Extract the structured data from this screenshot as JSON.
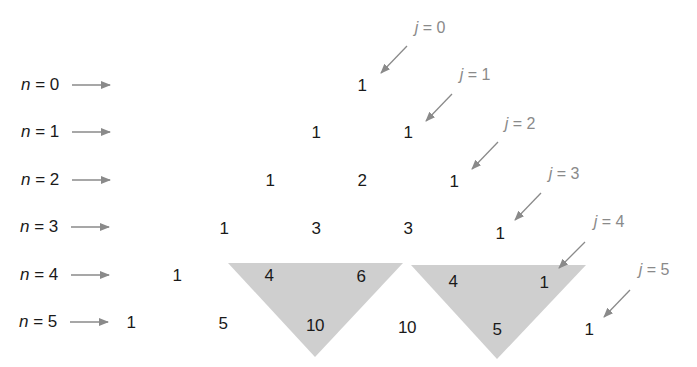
{
  "colors": {
    "text": "#1a1a1a",
    "arrow": "#8a8a8a",
    "label_j": "#8a8a8a",
    "highlight_fill": "#cfcfcf"
  },
  "row_labels": [
    {
      "var": "n",
      "eq": " = ",
      "value": "0"
    },
    {
      "var": "n",
      "eq": " = ",
      "value": "1"
    },
    {
      "var": "n",
      "eq": " = ",
      "value": "2"
    },
    {
      "var": "n",
      "eq": " = ",
      "value": "3"
    },
    {
      "var": "n",
      "eq": " = ",
      "value": "4"
    },
    {
      "var": "n",
      "eq": " = ",
      "value": "5"
    }
  ],
  "diagonal_labels": [
    {
      "var": "j",
      "eq": " = ",
      "value": "0"
    },
    {
      "var": "j",
      "eq": " = ",
      "value": "1"
    },
    {
      "var": "j",
      "eq": " = ",
      "value": "2"
    },
    {
      "var": "j",
      "eq": " = ",
      "value": "3"
    },
    {
      "var": "j",
      "eq": " = ",
      "value": "4"
    },
    {
      "var": "j",
      "eq": " = ",
      "value": "5"
    }
  ],
  "rows": [
    [
      "1"
    ],
    [
      "1",
      "1"
    ],
    [
      "1",
      "2",
      "1"
    ],
    [
      "1",
      "3",
      "3",
      "1"
    ],
    [
      "1",
      "4",
      "6",
      "4",
      "1"
    ],
    [
      "1",
      "5",
      "10",
      "10",
      "5",
      "1"
    ]
  ],
  "highlighted_triangles": [
    {
      "cells": [
        "4",
        "6",
        "10"
      ],
      "note": "4 + 6 = 10"
    },
    {
      "cells": [
        "4",
        "1",
        "5"
      ],
      "note": "4 + 1 = 5"
    }
  ]
}
